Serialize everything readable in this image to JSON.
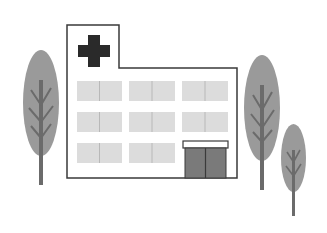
{
  "scene": {
    "subject": "hospital illustration",
    "colors": {
      "background": "#ffffff",
      "outline": "#3a3a3a",
      "cross": "#2a2a2a",
      "window": "#dcdcdc",
      "window_divider": "#b8b8b8",
      "door": "#7a7a7a",
      "canopy": "#ffffff",
      "tree_crown": "#9a9a9a",
      "tree_trunk": "#6b6b6b"
    },
    "building": {
      "label": "hospital-building",
      "window_rows": 3,
      "window_cols": 3
    },
    "trees": [
      {
        "name": "left-tree"
      },
      {
        "name": "right-tall-tree"
      },
      {
        "name": "right-small-tree"
      }
    ]
  }
}
